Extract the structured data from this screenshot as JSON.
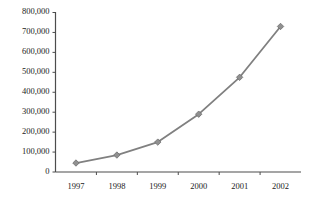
{
  "chart_data": {
    "type": "line",
    "title": "",
    "subtitle": "",
    "xlabel": "",
    "ylabel": "",
    "categories": [
      "1997",
      "1998",
      "1999",
      "2000",
      "2001",
      "2002"
    ],
    "values": [
      45000,
      85000,
      150000,
      290000,
      475000,
      730000
    ],
    "series": [
      {
        "name": "",
        "values": [
          45000,
          85000,
          150000,
          290000,
          475000,
          730000
        ]
      }
    ],
    "ylim": [
      0,
      800000
    ],
    "ytick_values": [
      0,
      100000,
      200000,
      300000,
      400000,
      500000,
      600000,
      700000,
      800000
    ],
    "ytick_labels": [
      "0",
      "100,000",
      "200,000",
      "300,000",
      "400,000",
      "500,000",
      "600,000",
      "700,000",
      "800,000"
    ],
    "xtick_labels": [
      "1997",
      "1998",
      "1999",
      "2000",
      "2001",
      "2002"
    ],
    "grid": false,
    "legend": false,
    "legend_position": "none",
    "annotations": [],
    "marker": "diamond",
    "colors": {
      "line": "#808080",
      "marker_fill": "#909090",
      "marker_stroke": "#6e6e6e",
      "axis": "#4d4d4d",
      "text": "#222222",
      "background": "#ffffff"
    }
  }
}
